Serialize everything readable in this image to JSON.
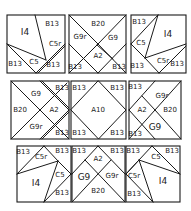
{
  "diagram": {
    "type": "quilt-block-layout",
    "rows": [
      {
        "blocks": [
          {
            "id": "r1b1",
            "labels": [
              "I4",
              "B13",
              "C5r",
              "C5",
              "B13",
              "B13"
            ]
          },
          {
            "id": "r1b2",
            "labels": [
              "B20",
              "G9r",
              "G9",
              "A2",
              "B13",
              "B13"
            ]
          },
          {
            "id": "r1b3",
            "labels": [
              "B13",
              "I4",
              "C5",
              "B13",
              "C5r",
              "B13"
            ]
          }
        ]
      },
      {
        "blocks": [
          {
            "id": "r2b1",
            "labels": [
              "G9",
              "B13",
              "B20",
              "A2",
              "G9r",
              "B13"
            ]
          },
          {
            "id": "r2b2",
            "labels": [
              "B13",
              "B13",
              "A10",
              "B13",
              "B13"
            ]
          },
          {
            "id": "r2b3",
            "labels": [
              "B13",
              "G9r",
              "A2",
              "B20",
              "B13",
              "G9"
            ]
          }
        ]
      },
      {
        "blocks": [
          {
            "id": "r3b1",
            "labels": [
              "B13",
              "C5r",
              "B13",
              "C5",
              "I4",
              "B13"
            ]
          },
          {
            "id": "r3b2",
            "labels": [
              "B13",
              "A2",
              "B13",
              "G9",
              "G9r",
              "B20"
            ]
          },
          {
            "id": "r3b3",
            "labels": [
              "B13",
              "C5",
              "B13",
              "C5r",
              "I4",
              "B13"
            ]
          }
        ]
      }
    ]
  },
  "labels": {
    "r1b1": {
      "i4": "I4",
      "b13_tr": "B13",
      "c5r": "C5r",
      "c5": "C5",
      "b13_bl": "B13",
      "b13_br": "B13"
    },
    "r1b2": {
      "b20": "B20",
      "g9r": "G9r",
      "g9": "G9",
      "a2": "A2",
      "b13_bl": "B13",
      "b13_br": "B13"
    },
    "r1b3": {
      "b13_tl": "B13",
      "i4": "I4",
      "c5": "C5",
      "b13_bl": "B13",
      "c5r": "C5r",
      "b13_br": "B13"
    },
    "r2b1": {
      "g9": "G9",
      "b13_tr": "B13",
      "b20": "B20",
      "a2": "A2",
      "g9r": "G9r",
      "b13_br": "B13"
    },
    "r2b2": {
      "b13_tl": "B13",
      "b13_tr": "B13",
      "a10": "A10",
      "b13_bl": "B13",
      "b13_br": "B13"
    },
    "r2b3": {
      "b13_tl": "B13",
      "g9r": "G9r",
      "a2": "A2",
      "b20": "B20",
      "b13_bl": "B13",
      "g9": "G9"
    },
    "r3b1": {
      "b13_tl": "B13",
      "c5r": "C5r",
      "b13_tr": "B13",
      "c5": "C5",
      "i4": "I4",
      "b13_b": "B13"
    },
    "r3b2": {
      "b13_tl": "B13",
      "a2": "A2",
      "b13_tr": "B13",
      "g9": "G9",
      "g9r": "G9r",
      "b20": "B20"
    },
    "r3b3": {
      "b13_tl": "B13",
      "c5": "C5",
      "b13_tr": "B13",
      "c5r": "C5r",
      "i4": "I4",
      "b13_b": "B13"
    }
  }
}
